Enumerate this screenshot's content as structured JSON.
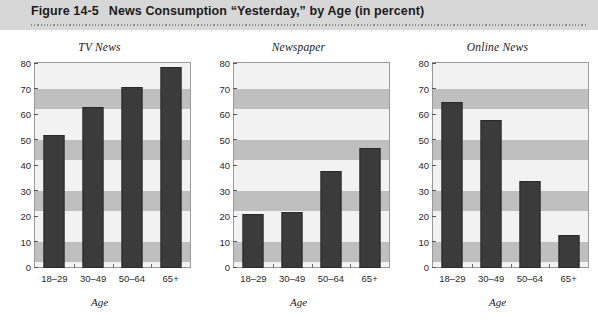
{
  "header": {
    "figure_number": "Figure 14-5",
    "title": "News Consumption “Yesterday,” by Age (in percent)",
    "band_color": "#d7d7d7",
    "text_color": "#1b1b1b"
  },
  "style": {
    "bar_color": "#3b3b3b",
    "plot_background": "#f2f2f2",
    "band_color": "#bfbfbf",
    "axis_color": "#9a9a9a"
  },
  "chart_data": [
    {
      "type": "bar",
      "title": "TV News",
      "categories": [
        "18–29",
        "30–49",
        "50–64",
        "65+"
      ],
      "values": [
        52,
        63,
        71,
        79
      ],
      "xlabel": "Age",
      "ylabel": "",
      "ylim": [
        0,
        80
      ],
      "yticks": [
        0,
        10,
        20,
        30,
        40,
        50,
        60,
        70,
        80
      ],
      "grid": false,
      "legend": "none"
    },
    {
      "type": "bar",
      "title": "Newspaper",
      "categories": [
        "18–29",
        "30–49",
        "50–64",
        "65+"
      ],
      "values": [
        21,
        22,
        38,
        47
      ],
      "xlabel": "Age",
      "ylabel": "",
      "ylim": [
        0,
        80
      ],
      "yticks": [
        0,
        10,
        20,
        30,
        40,
        50,
        60,
        70,
        80
      ],
      "grid": false,
      "legend": "none"
    },
    {
      "type": "bar",
      "title": "Online News",
      "categories": [
        "18–29",
        "30–49",
        "50–64",
        "65+"
      ],
      "values": [
        65,
        58,
        34,
        13
      ],
      "xlabel": "Age",
      "ylabel": "",
      "ylim": [
        0,
        80
      ],
      "yticks": [
        0,
        10,
        20,
        30,
        40,
        50,
        60,
        70,
        80
      ],
      "grid": false,
      "legend": "none"
    }
  ]
}
